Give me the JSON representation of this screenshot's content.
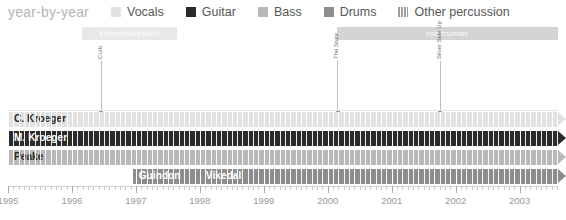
{
  "legend": {
    "title": "year-by-year",
    "items": [
      {
        "label": "Vocals",
        "color": "#e2e2e2",
        "icon": "square-swatch"
      },
      {
        "label": "Guitar",
        "color": "#2b2b2b",
        "icon": "square-swatch"
      },
      {
        "label": "Bass",
        "color": "#b9b9b9",
        "icon": "square-swatch"
      },
      {
        "label": "Drums",
        "color": "#8d8d8d",
        "icon": "square-swatch"
      },
      {
        "label": "Other percussion",
        "color": "#9e9e9e",
        "icon": "striped-swatch"
      }
    ]
  },
  "chart_data": {
    "type": "bar",
    "title": "year-by-year",
    "xlabel": "",
    "ylabel": "",
    "xlim": [
      1995,
      2003.6
    ],
    "grid": true,
    "legend_position": "top",
    "categories": [
      "C. Kroeger",
      "M. Kroeger",
      "Peake",
      "Guindon",
      "Vikedal"
    ],
    "tick_labels": [
      "1995",
      "1996",
      "1997",
      "1998",
      "1999",
      "2000",
      "2001",
      "2002",
      "2003"
    ],
    "tick_values": [
      1995,
      1996,
      1997,
      1998,
      1999,
      2000,
      2001,
      2002,
      2003
    ],
    "minor_ticks_per_year": 12,
    "series": [
      {
        "name": "C. Kroeger",
        "role": "Vocals",
        "color": "#e2e2e2",
        "text_color": "#2b2b2b",
        "start": 1995.0,
        "end": 2003.6,
        "ongoing": true,
        "row": 0
      },
      {
        "name": "M. Kroeger",
        "role": "Guitar",
        "color": "#2b2b2b",
        "text_color": "#ffffff",
        "start": 1995.0,
        "end": 2003.6,
        "ongoing": true,
        "row": 1
      },
      {
        "name": "Peake",
        "role": "Bass",
        "color": "#b9b9b9",
        "text_color": "#2b2b2b",
        "start": 1995.0,
        "end": 2003.6,
        "ongoing": true,
        "row": 2
      },
      {
        "name": "Guindon",
        "role": "Drums",
        "color": "#8d8d8d",
        "text_color": "#ffffff",
        "start": 1996.95,
        "end": 1998.0,
        "ongoing": false,
        "row": 3
      },
      {
        "name": "Vikedal",
        "role": "Drums",
        "color": "#8d8d8d",
        "text_color": "#ffffff",
        "start": 1998.0,
        "end": 2003.6,
        "ongoing": true,
        "row": 3
      }
    ],
    "eras": [
      {
        "label": "shoreline/select",
        "start": 1996.15,
        "end": 1997.65,
        "color": "#e8e8e8",
        "ongoing": false
      },
      {
        "label": "roadrunner",
        "start": 2000.15,
        "end": 2003.6,
        "color": "#d4d4d4",
        "ongoing": true
      }
    ],
    "releases": [
      {
        "label": "Curb",
        "year": 1996.45
      },
      {
        "label": "The State",
        "year": 2000.15
      },
      {
        "label": "Silver Side Up",
        "year": 2001.75
      }
    ]
  }
}
